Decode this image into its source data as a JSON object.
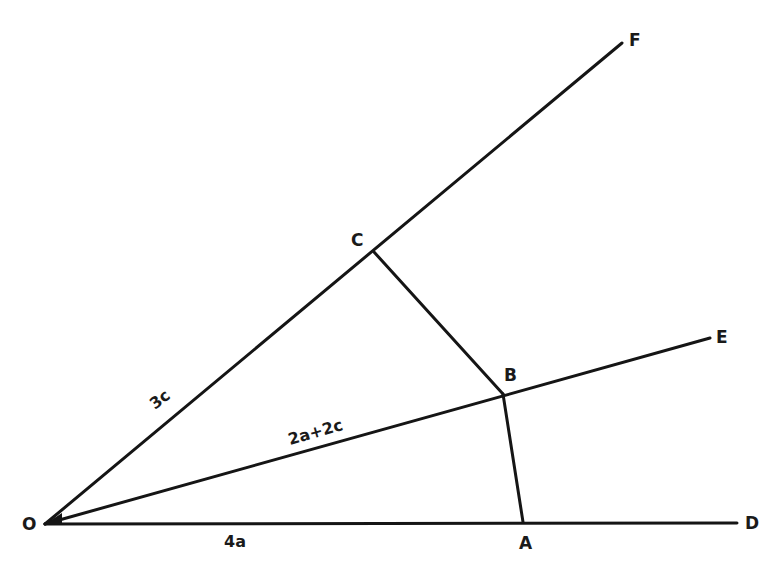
{
  "diagram": {
    "points": {
      "O": {
        "label": "O",
        "x": 45,
        "y": 524
      },
      "A": {
        "label": "A",
        "x": 523,
        "y": 522
      },
      "B": {
        "label": "B",
        "x": 503,
        "y": 394
      },
      "C": {
        "label": "C",
        "x": 374,
        "y": 252
      },
      "D": {
        "label": "D",
        "x": 737,
        "y": 523
      },
      "E": {
        "label": "E",
        "x": 710,
        "y": 338
      },
      "F": {
        "label": "F",
        "x": 622,
        "y": 43
      }
    },
    "segment_labels": {
      "OC": "3c",
      "OB": "2a+2c",
      "OA": "4a"
    },
    "rays": [
      "OD",
      "OE",
      "OF"
    ],
    "segments": [
      "CB",
      "BA"
    ],
    "colors": {
      "line": "#151515",
      "background": "#ffffff"
    }
  }
}
